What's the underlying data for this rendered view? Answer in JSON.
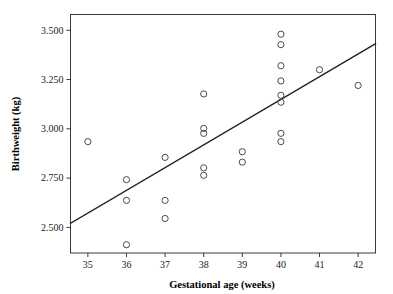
{
  "chart_data": {
    "type": "scatter",
    "title": "",
    "subtitle": "",
    "xlabel": "Gestational age (weeks)",
    "ylabel": "Birthweight (kg)",
    "xlim": [
      34.55,
      42.45
    ],
    "ylim": [
      2.37,
      3.58
    ],
    "xticks": [
      35,
      36,
      37,
      38,
      39,
      40,
      41,
      42
    ],
    "xtick_labels": [
      "35",
      "36",
      "37",
      "38",
      "39",
      "40",
      "41",
      "42"
    ],
    "yticks": [
      2.5,
      2.75,
      3.0,
      3.25,
      3.5
    ],
    "ytick_labels": [
      "2.500",
      "2.750",
      "3.000",
      "3.250",
      "3.500"
    ],
    "grid": false,
    "legend": null,
    "marker": "open-circle",
    "marker_size": 3.1,
    "point_count": 27,
    "x": [
      35,
      36,
      36,
      36,
      37,
      37,
      37,
      38,
      38,
      38,
      38,
      38,
      39,
      39,
      40,
      40,
      40,
      40,
      40,
      40,
      40,
      40,
      41,
      42
    ],
    "y": [
      2.935,
      2.742,
      2.637,
      2.412,
      2.855,
      2.637,
      2.545,
      3.177,
      3.002,
      2.977,
      2.802,
      2.764,
      2.884,
      2.831,
      3.48,
      3.427,
      3.32,
      3.243,
      3.17,
      3.135,
      2.977,
      2.935,
      3.3,
      3.22
    ],
    "points": [
      {
        "x": 35,
        "y": 2.935
      },
      {
        "x": 36,
        "y": 2.742
      },
      {
        "x": 36,
        "y": 2.637
      },
      {
        "x": 36,
        "y": 2.412
      },
      {
        "x": 37,
        "y": 2.855
      },
      {
        "x": 37,
        "y": 2.637
      },
      {
        "x": 37,
        "y": 2.545
      },
      {
        "x": 38,
        "y": 3.177
      },
      {
        "x": 38,
        "y": 3.002
      },
      {
        "x": 38,
        "y": 2.977
      },
      {
        "x": 38,
        "y": 2.802
      },
      {
        "x": 38,
        "y": 2.764
      },
      {
        "x": 39,
        "y": 2.884
      },
      {
        "x": 39,
        "y": 2.831
      },
      {
        "x": 40,
        "y": 3.48
      },
      {
        "x": 40,
        "y": 3.427
      },
      {
        "x": 40,
        "y": 3.32
      },
      {
        "x": 40,
        "y": 3.243
      },
      {
        "x": 40,
        "y": 3.17
      },
      {
        "x": 40,
        "y": 3.135
      },
      {
        "x": 40,
        "y": 2.977
      },
      {
        "x": 40,
        "y": 2.935
      },
      {
        "x": 41,
        "y": 3.3
      },
      {
        "x": 42,
        "y": 3.22
      }
    ],
    "fit_line": {
      "type": "linear-regression",
      "x_start": 34.55,
      "y_start": 2.521,
      "x_end": 42.45,
      "y_end": 3.432,
      "slope": 0.1153,
      "intercept": -1.463
    },
    "colors": {
      "marker_stroke": "#4a4a4a",
      "line": "#222222",
      "axis": "#3a3a3a",
      "text": "#1a1a1a",
      "background": "#ffffff"
    }
  }
}
